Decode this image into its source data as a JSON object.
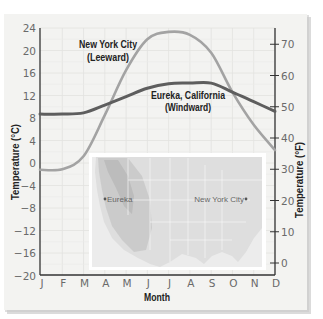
{
  "chart_data": {
    "type": "line",
    "title": "",
    "xlabel": "Month",
    "ylabel": "Temperature (°C)",
    "ylabel_right": "Temperature (°F)",
    "categories": [
      "J",
      "F",
      "M",
      "A",
      "M",
      "J",
      "J",
      "A",
      "S",
      "O",
      "N",
      "D"
    ],
    "ylim": [
      -20,
      24
    ],
    "yticks": [
      24,
      20,
      16,
      12,
      8,
      4,
      0,
      -4,
      -8,
      -12,
      -16,
      -20
    ],
    "ytick_labels": [
      "24",
      "20",
      "16",
      "12",
      "8",
      "4",
      "0",
      "−4",
      "−8",
      "−12",
      "−16",
      "−20"
    ],
    "ylim_right": [
      -3.2,
      75.2
    ],
    "yticks_right": [
      70,
      60,
      50,
      40,
      30,
      20,
      10,
      0
    ],
    "ytick_labels_right": [
      "70",
      "60",
      "50",
      "40",
      "30",
      "20",
      "10",
      "0"
    ],
    "grid": true,
    "legend": "none (direct labels)",
    "series": [
      {
        "name": "New York City (Leeward)",
        "color": "#a3a3a3",
        "values": [
          -1.2,
          -1.1,
          1.2,
          8.5,
          16.5,
          22.0,
          23.3,
          22.8,
          19.6,
          12.6,
          6.8,
          2.3
        ]
      },
      {
        "name": "Eureka, California (Windward)",
        "color": "#5e5e5e",
        "values": [
          8.7,
          8.7,
          8.9,
          10.3,
          11.8,
          13.3,
          14.1,
          14.2,
          14.2,
          12.6,
          10.9,
          9.2
        ]
      }
    ],
    "annotations": [
      {
        "line1": "New York City",
        "line2": "(Leeward)",
        "series": 0
      },
      {
        "line1": "Eureka, California",
        "line2": "(Windward)",
        "series": 1
      }
    ]
  },
  "inset_map": {
    "description": "map of the contiguous United States",
    "labels": [
      {
        "name": "Eureka",
        "text": "Eureka"
      },
      {
        "name": "New York City",
        "text": "New York City"
      }
    ]
  }
}
